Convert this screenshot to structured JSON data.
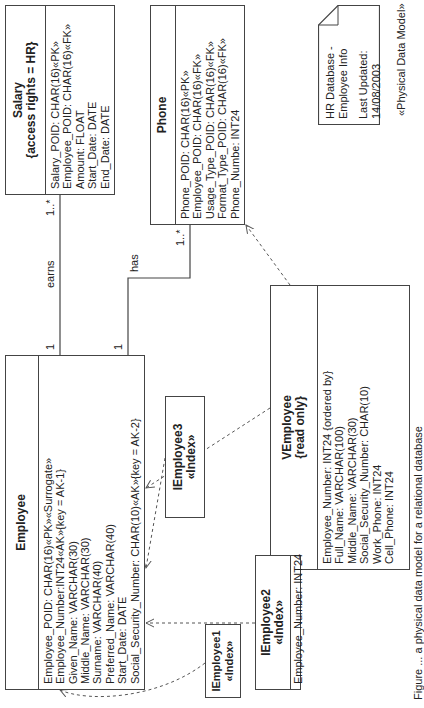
{
  "diagram": {
    "title_stereotype": "«Physical Data Model»",
    "note": {
      "line1": "HR Database -",
      "line2": "Employee Info",
      "line3": "Last Updated: 14/08/2003"
    },
    "caption": "Figure ... a physical data model for a relational database",
    "tables": {
      "salary": {
        "name": "Salary",
        "subtitle": "{access rights = HR}",
        "attributes": [
          "Salary_POID: CHAR(16)«PK»",
          "Employee_POID: CHAR(16)«FK»",
          "Amount: FLOAT",
          "Start_Date: DATE",
          "End_Date: DATE"
        ]
      },
      "phone": {
        "name": "Phone",
        "attributes": [
          "Phone_POID: CHAR(16)«PK»",
          "Employee_POID: CHAR(16)«FK»",
          "Usage_Type_POID: CHAR(16)«FK»",
          "Format_Type_POID: CHAR(16)«FK»",
          "Phone_Numbe: INT24"
        ]
      },
      "employee": {
        "name": "Employee",
        "attributes": [
          "Employee_POID: CHAR(16)«PK»«Surrogate»",
          "Employee_Number:INT24«AK»{key = AK-1}",
          "Given_Name: VARCHAR(30)",
          "Middle_Name: VARCHAR(30)",
          "Surname: VARCHAR(40)",
          "Preferred_Name: VARCHAR(40)",
          "Start_Date: DATE",
          "Social_Security_Number: CHAR(10)«AK»{key = AK-2}"
        ]
      },
      "vemployee": {
        "name": "VEmployee",
        "subtitle": "{read only}",
        "attributes": [
          "Employee_Number: INT24 {ordered by}",
          "Full_Name: VARCHAR(100)",
          "Middle_Name: VARCHAR(30)",
          "Social_Security_Number: CHAR(10)",
          "Work_Phone: INT24",
          "Cell_Phone: INT24"
        ]
      },
      "iemployee1": {
        "name": "IEmployee1",
        "stereotype": "«Index»"
      },
      "iemployee2": {
        "name": "IEmployee2",
        "stereotype": "«Index»",
        "attributes": [
          "Employee_Number: INT24"
        ]
      },
      "iemployee3": {
        "name": "IEmployee3",
        "stereotype": "«Index»"
      }
    },
    "associations": {
      "earns": {
        "label": "earns",
        "source_mult": "1",
        "target_mult": "1..*"
      },
      "has": {
        "label": "has",
        "source_mult": "1",
        "target_mult": "1..*"
      }
    }
  }
}
